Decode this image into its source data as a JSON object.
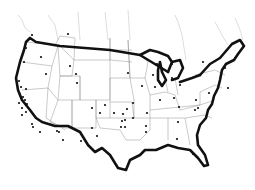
{
  "map": {
    "region": "Contiguous United States",
    "style": "outline map with state borders",
    "colors": {
      "outline": "#111111",
      "borders": "#888888",
      "dots": "#111111",
      "background": "#ffffff"
    },
    "points": [
      [
        32,
        35
      ],
      [
        68,
        34
      ],
      [
        26,
        48
      ],
      [
        24,
        62
      ],
      [
        41,
        57
      ],
      [
        70,
        66
      ],
      [
        46,
        74
      ],
      [
        76,
        74
      ],
      [
        77,
        83
      ],
      [
        19,
        81
      ],
      [
        21,
        87
      ],
      [
        26,
        89
      ],
      [
        23,
        97
      ],
      [
        25,
        100
      ],
      [
        19,
        103
      ],
      [
        27,
        104
      ],
      [
        22,
        108
      ],
      [
        26,
        112
      ],
      [
        22,
        115
      ],
      [
        32,
        124
      ],
      [
        33,
        127
      ],
      [
        40,
        132
      ],
      [
        57,
        131
      ],
      [
        59,
        132
      ],
      [
        63,
        140
      ],
      [
        92,
        108
      ],
      [
        105,
        105
      ],
      [
        100,
        113
      ],
      [
        81,
        141
      ],
      [
        92,
        128
      ],
      [
        97,
        136
      ],
      [
        127,
        109
      ],
      [
        123,
        114
      ],
      [
        125,
        120
      ],
      [
        122,
        121
      ],
      [
        121,
        127
      ],
      [
        125,
        127
      ],
      [
        114,
        113
      ],
      [
        133,
        118
      ],
      [
        146,
        132
      ],
      [
        147,
        113
      ],
      [
        146,
        126
      ],
      [
        128,
        73
      ],
      [
        133,
        103
      ],
      [
        142,
        86
      ],
      [
        153,
        75
      ],
      [
        155,
        87
      ],
      [
        172,
        78
      ],
      [
        174,
        98
      ],
      [
        160,
        100
      ],
      [
        180,
        85
      ],
      [
        196,
        100
      ],
      [
        198,
        108
      ],
      [
        179,
        107
      ],
      [
        195,
        110
      ],
      [
        178,
        122
      ],
      [
        177,
        139
      ],
      [
        193,
        154
      ],
      [
        203,
        62
      ],
      [
        225,
        68
      ],
      [
        228,
        88
      ],
      [
        209,
        93
      ],
      [
        157,
        64
      ],
      [
        172,
        64
      ]
    ]
  }
}
